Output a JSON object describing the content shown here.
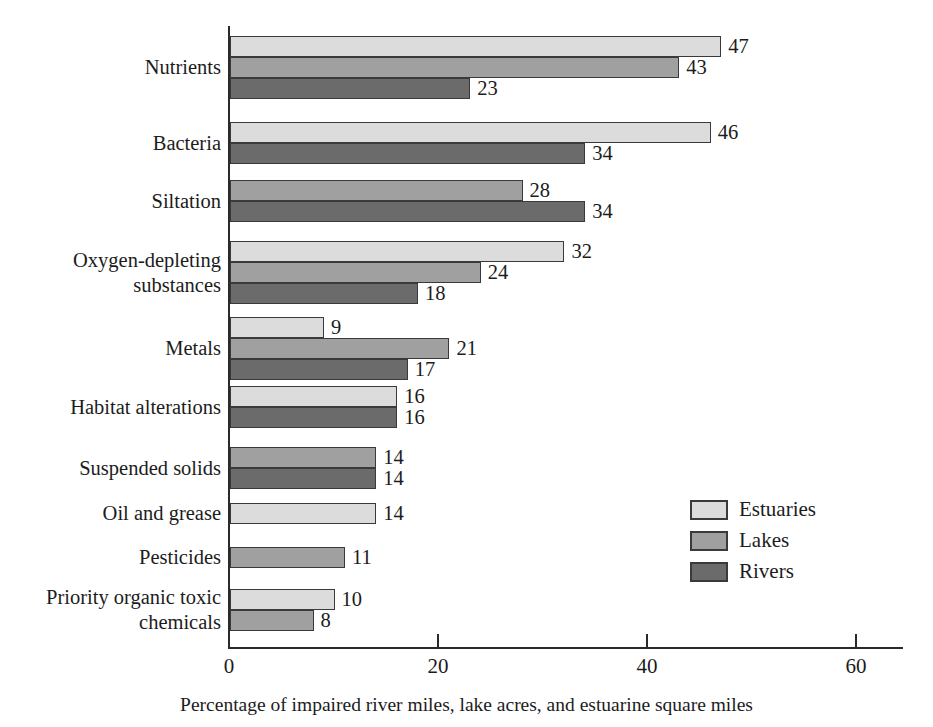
{
  "chart_data": {
    "type": "bar",
    "orientation": "horizontal",
    "title": "",
    "xlabel": "Percentage of impaired river miles, lake acres, and estuarine square miles",
    "ylabel": "",
    "xlim": [
      0,
      64.5
    ],
    "xticks": [
      0,
      20,
      40,
      60
    ],
    "xtick_labels": [
      "0",
      "20",
      "40",
      "60"
    ],
    "grid": false,
    "legend_position": "middle-right",
    "categories": [
      "Nutrients",
      "Bacteria",
      "Siltation",
      "Oxygen-depleting substances",
      "Metals",
      "Habitat alterations",
      "Suspended solids",
      "Oil and grease",
      "Pesticides",
      "Priority organic toxic chemicals"
    ],
    "series": [
      {
        "name": "Estuaries",
        "color": "#dcdcdc",
        "values": [
          47,
          46,
          null,
          32,
          9,
          16,
          null,
          14,
          null,
          10
        ]
      },
      {
        "name": "Lakes",
        "color": "#a0a0a0",
        "values": [
          43,
          null,
          28,
          24,
          21,
          null,
          14,
          null,
          11,
          8
        ]
      },
      {
        "name": "Rivers",
        "color": "#6b6b6b",
        "values": [
          23,
          34,
          34,
          18,
          17,
          16,
          14,
          null,
          null,
          null
        ]
      }
    ]
  },
  "axis": {
    "ticks": [
      {
        "label": "0",
        "value": 0
      },
      {
        "label": "20",
        "value": 20
      },
      {
        "label": "40",
        "value": 40
      },
      {
        "label": "60",
        "value": 60
      }
    ],
    "caption": "Percentage of impaired river miles, lake acres, and estuarine square miles"
  },
  "categories": [
    {
      "label": "Nutrients"
    },
    {
      "label": "Bacteria"
    },
    {
      "label": "Siltation"
    },
    {
      "label": "Oxygen-depleting\nsubstances"
    },
    {
      "label": "Metals"
    },
    {
      "label": "Habitat alterations"
    },
    {
      "label": "Suspended solids"
    },
    {
      "label": "Oil and grease"
    },
    {
      "label": "Pesticides"
    },
    {
      "label": "Priority organic toxic\nchemicals"
    }
  ],
  "bars": [
    {
      "group": "Nutrients",
      "series": "Estuaries",
      "value": 47,
      "label": "47"
    },
    {
      "group": "Nutrients",
      "series": "Lakes",
      "value": 43,
      "label": "43"
    },
    {
      "group": "Nutrients",
      "series": "Rivers",
      "value": 23,
      "label": "23"
    },
    {
      "group": "Bacteria",
      "series": "Estuaries",
      "value": 46,
      "label": "46"
    },
    {
      "group": "Bacteria",
      "series": "Rivers",
      "value": 34,
      "label": "34"
    },
    {
      "group": "Siltation",
      "series": "Lakes",
      "value": 28,
      "label": "28"
    },
    {
      "group": "Siltation",
      "series": "Rivers",
      "value": 34,
      "label": "34"
    },
    {
      "group": "Oxygen-depleting substances",
      "series": "Estuaries",
      "value": 32,
      "label": "32"
    },
    {
      "group": "Oxygen-depleting substances",
      "series": "Lakes",
      "value": 24,
      "label": "24"
    },
    {
      "group": "Oxygen-depleting substances",
      "series": "Rivers",
      "value": 18,
      "label": "18"
    },
    {
      "group": "Metals",
      "series": "Estuaries",
      "value": 9,
      "label": "9"
    },
    {
      "group": "Metals",
      "series": "Lakes",
      "value": 21,
      "label": "21"
    },
    {
      "group": "Metals",
      "series": "Rivers",
      "value": 17,
      "label": "17"
    },
    {
      "group": "Habitat alterations",
      "series": "Estuaries",
      "value": 16,
      "label": "16"
    },
    {
      "group": "Habitat alterations",
      "series": "Rivers",
      "value": 16,
      "label": "16"
    },
    {
      "group": "Suspended solids",
      "series": "Lakes",
      "value": 14,
      "label": "14"
    },
    {
      "group": "Suspended solids",
      "series": "Rivers",
      "value": 14,
      "label": "14"
    },
    {
      "group": "Oil and grease",
      "series": "Estuaries",
      "value": 14,
      "label": "14"
    },
    {
      "group": "Pesticides",
      "series": "Lakes",
      "value": 11,
      "label": "11"
    },
    {
      "group": "Priority organic toxic chemicals",
      "series": "Estuaries",
      "value": 10,
      "label": "10"
    },
    {
      "group": "Priority organic toxic chemicals",
      "series": "Lakes",
      "value": 8,
      "label": "8"
    }
  ],
  "legend": {
    "items": [
      {
        "label": "Estuaries",
        "color": "#dcdcdc"
      },
      {
        "label": "Lakes",
        "color": "#a0a0a0"
      },
      {
        "label": "Rivers",
        "color": "#6b6b6b"
      }
    ]
  },
  "colors": {
    "estuaries": "#dcdcdc",
    "lakes": "#a0a0a0",
    "rivers": "#6b6b6b",
    "axis": "#2a2a2a",
    "text": "#1c1c1c",
    "background": "#ffffff"
  }
}
